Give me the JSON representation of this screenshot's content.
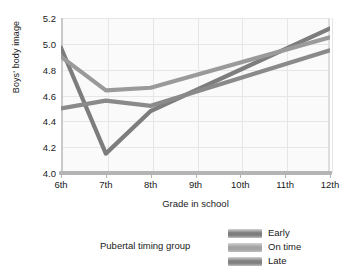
{
  "chart_data": {
    "type": "line",
    "title": "",
    "xlabel": "Grade in school",
    "ylabel": "Boys' body image",
    "categories": [
      "6th",
      "7th",
      "8th",
      "9th",
      "10th",
      "11th",
      "12th"
    ],
    "x_tick_labels": [
      "6th",
      "7th",
      "8th",
      "9th",
      "10th",
      "11th",
      "12th"
    ],
    "y_tick_labels": [
      "5.2",
      "5.0",
      "4.8",
      "4.6",
      "4.4",
      "4.2",
      "4.0"
    ],
    "ylim": [
      4.0,
      5.2
    ],
    "y_ticks": [
      4.0,
      4.2,
      4.4,
      4.6,
      4.8,
      5.0,
      5.2
    ],
    "grid": true,
    "legend_position": "bottom-right",
    "legend_title": "Pubertal timing group",
    "series": [
      {
        "name": "Early",
        "color": "#7d7d7d",
        "x": [
          "6th",
          "7th",
          "8th",
          "12th"
        ],
        "values": [
          4.97,
          4.15,
          4.48,
          5.12
        ]
      },
      {
        "name": "On time",
        "color": "#9a9a9a",
        "x": [
          "6th",
          "7th",
          "8th",
          "12th"
        ],
        "values": [
          4.9,
          4.64,
          4.66,
          5.05
        ]
      },
      {
        "name": "Late",
        "color": "#8a8a8a",
        "x": [
          "6th",
          "7th",
          "8th",
          "12th"
        ],
        "values": [
          4.5,
          4.56,
          4.52,
          4.95
        ]
      }
    ]
  },
  "legend": {
    "caption": "Pubertal timing group",
    "entries": [
      {
        "label": "Early",
        "color": "#7d7d7d"
      },
      {
        "label": "On time",
        "color": "#a3a3a3"
      },
      {
        "label": "Late",
        "color": "#818181"
      }
    ]
  },
  "colors": {
    "plot_background": "#fafafa",
    "gridline": "#e6e6e6",
    "axis": "#b4b4b4",
    "text": "#1a1a1a"
  }
}
